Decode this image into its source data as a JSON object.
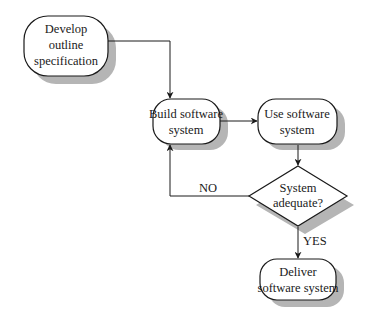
{
  "diagram": {
    "type": "flowchart",
    "nodes": [
      {
        "id": "develop",
        "shape": "terminal",
        "lines": [
          "Develop",
          "outline",
          "specification"
        ]
      },
      {
        "id": "build",
        "shape": "terminal",
        "lines": [
          "Build software",
          "system"
        ]
      },
      {
        "id": "use",
        "shape": "terminal",
        "lines": [
          "Use software",
          "system"
        ]
      },
      {
        "id": "decision",
        "shape": "diamond",
        "lines": [
          "System",
          "adequate?"
        ]
      },
      {
        "id": "deliver",
        "shape": "terminal",
        "lines": [
          "Deliver",
          "software system"
        ]
      }
    ],
    "edges": [
      {
        "from": "develop",
        "to": "build",
        "label": ""
      },
      {
        "from": "build",
        "to": "use",
        "label": ""
      },
      {
        "from": "use",
        "to": "decision",
        "label": ""
      },
      {
        "from": "decision",
        "to": "build",
        "label": "NO"
      },
      {
        "from": "decision",
        "to": "deliver",
        "label": "YES"
      }
    ],
    "colors": {
      "stroke": "#1a1a1a",
      "shadow": "#b5b5b5",
      "fill": "#ffffff"
    }
  }
}
